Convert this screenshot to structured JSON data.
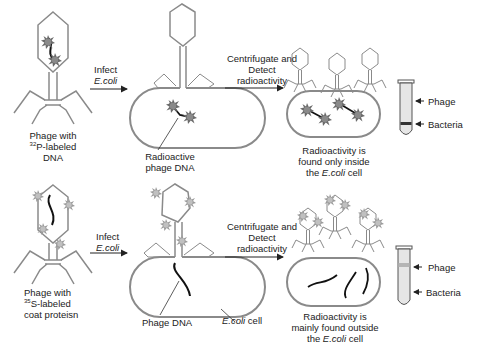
{
  "figure": {
    "rows": [
      {
        "id": "p32",
        "start_label": {
          "line1": "Phage with",
          "isotope_mass": "32",
          "isotope_suffix": "P-labeled",
          "line3": "DNA"
        },
        "step1": {
          "line1": "Infect",
          "line2": "E.coli"
        },
        "infected_label": {
          "line1": "Radioactive",
          "line2": "phage DNA"
        },
        "step2": {
          "line1": "Centrifugate and",
          "line2": "Detect",
          "line3": "radioactivity"
        },
        "result": {
          "line1": "Radioactivity is",
          "line2": "found only inside",
          "line3_pre": "the ",
          "line3_it": "E.coli",
          "line3_post": " cell"
        },
        "tube": {
          "top_label": "Phage",
          "bottom_label": "Bacteria",
          "radioactive_band": "bottom"
        }
      },
      {
        "id": "s35",
        "start_label": {
          "line1": "Phage with",
          "isotope_mass": "35",
          "isotope_suffix": "S-labeled",
          "line3": "coat proteisn"
        },
        "step1": {
          "line1": "Infect",
          "line2": "E.coli"
        },
        "infected_label": {
          "line1": "Phage DNA"
        },
        "cell_label": {
          "italic": "E.coli",
          "post": " cell"
        },
        "step2": {
          "line1": "Centrifugate  and",
          "line2": "Detect",
          "line3": "radioactivity"
        },
        "result": {
          "line1": "Radioactivity is",
          "line2": "mainly found outside",
          "line3_pre": "the ",
          "line3_it": "E.coli",
          "line3_post": " cell"
        },
        "tube": {
          "top_label": "Phage",
          "bottom_label": "Bacteria",
          "radioactive_band": "top"
        }
      }
    ],
    "marker_text": {
      "p": "32P",
      "s": "35S"
    }
  },
  "colors": {
    "outline": "#7a7a7a",
    "dna": "#111111",
    "marker": "#555555",
    "tube_fill": "#e6e6e6",
    "band_dark": "#333333",
    "band_light": "#b5b5b5"
  }
}
